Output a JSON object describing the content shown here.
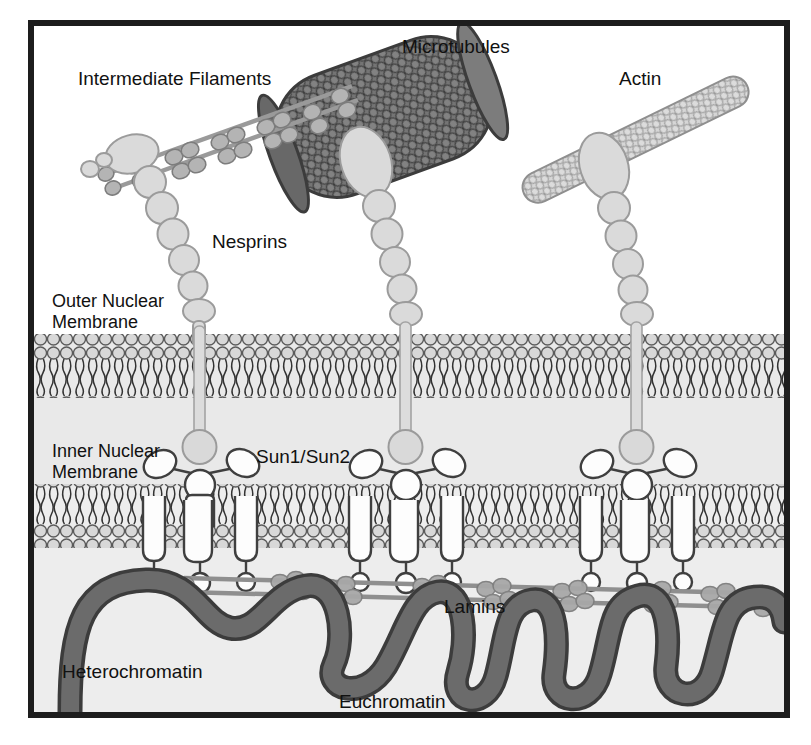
{
  "figure": {
    "background_color": "#fbfbfb",
    "frame_color": "#1d1d1d"
  },
  "labels": {
    "intermediate_filaments": "Intermediate Filaments",
    "microtubules": "Microtubules",
    "actin": "Actin",
    "nesprins": "Nesprins",
    "outer_nuclear_membrane": "Outer Nuclear\nMembrane",
    "outer_nuclear_membrane_line1": "Outer Nuclear",
    "outer_nuclear_membrane_line2": "Membrane",
    "inner_nuclear_membrane_line1": "Inner Nuclear",
    "inner_nuclear_membrane_line2": "Membrane",
    "sun_proteins": "Sun1/Sun2",
    "lamins": "Lamins",
    "heterochromatin": "Heterochromatin",
    "euchromatin": "Euchromatin"
  },
  "colors": {
    "cytoplasm": "#ffffff",
    "perinuclear_space": "#e9e9e9",
    "nucleoplasm": "#ededed",
    "membrane_head_fill": "#d8d8d8",
    "membrane_outline": "#555555",
    "lipid_tail": "#3a3a3a",
    "microtubule_fill": "#6f6f6f",
    "microtubule_outline": "#3d3d3d",
    "actin_fill": "#d2d2d2",
    "actin_outline": "#8d8d8d",
    "nesprin_fill": "#d9d9d9",
    "nesprin_outline": "#9a9a9a",
    "if_rod": "#9a9a9a",
    "if_bead": "#b4b4b4",
    "sun_fill": "#fdfdfd",
    "sun_outline": "#444444",
    "lamin_rod": "#8f8f8f",
    "lamin_bead": "#a8a8a8",
    "chromatin_fill": "#6b6b6b",
    "chromatin_outline": "#3c3c3c",
    "text": "#111111"
  },
  "structures": {
    "cytoskeletal_elements": [
      "Intermediate Filaments",
      "Microtubules",
      "Actin"
    ],
    "membranes": [
      "Outer Nuclear Membrane",
      "Inner Nuclear Membrane"
    ],
    "linc_components": [
      "Nesprins",
      "Sun1/Sun2"
    ],
    "nuclear_interior": [
      "Lamins",
      "Heterochromatin",
      "Euchromatin"
    ],
    "linc_complex_count": 3
  }
}
